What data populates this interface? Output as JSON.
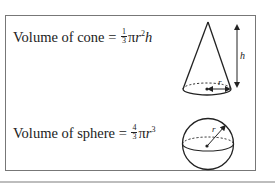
{
  "cone": {
    "label": "Volume of cone",
    "equals": "=",
    "frac_num": "1",
    "frac_den": "3",
    "pi": "π",
    "r": "r",
    "r_exp": "2",
    "h": "h",
    "diagram_labels": {
      "height": "h",
      "radius": "r"
    }
  },
  "sphere": {
    "label": "Volume of sphere",
    "equals": "=",
    "frac_num": "4",
    "frac_den": "3",
    "pi": "π",
    "r": "r",
    "r_exp": "3",
    "diagram_labels": {
      "radius": "r"
    }
  }
}
